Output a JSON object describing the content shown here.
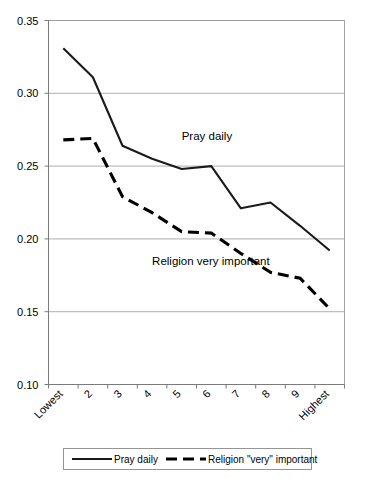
{
  "chart_data": {
    "type": "line",
    "title": "",
    "subtitle": "",
    "xlabel": "",
    "ylabel": "",
    "categories": [
      "Lowest",
      "2",
      "3",
      "4",
      "5",
      "6",
      "7",
      "8",
      "9",
      "Highest"
    ],
    "series": [
      {
        "name": "Pray daily",
        "style": "solid",
        "color": "#1a1a1a",
        "values": [
          0.331,
          0.311,
          0.264,
          0.255,
          0.248,
          0.25,
          0.221,
          0.225,
          0.209,
          0.192
        ]
      },
      {
        "name": "Religion \"very\" important",
        "style": "dashed",
        "color": "#000000",
        "values": [
          0.268,
          0.269,
          0.229,
          0.218,
          0.205,
          0.204,
          0.19,
          0.177,
          0.173,
          0.152
        ]
      }
    ],
    "ylim": [
      0.1,
      0.35
    ],
    "yticks": [
      "0.35",
      "0.30",
      "0.25",
      "0.20",
      "0.15",
      "0.10"
    ],
    "ytick_values": [
      0.35,
      0.3,
      0.25,
      0.2,
      0.15,
      0.1
    ],
    "grid": true,
    "grid_axis": "y",
    "legend_position": "bottom",
    "annotations": [
      {
        "text": "Pray daily",
        "x_category": "5",
        "y_value": 0.268
      },
      {
        "text": "Religion very important",
        "x_category": "4",
        "y_value": 0.182
      }
    ]
  },
  "legend": {
    "items": [
      {
        "label": "Pray daily",
        "style": "solid"
      },
      {
        "label": "Religion \"very\" important",
        "style": "dashed"
      }
    ]
  }
}
